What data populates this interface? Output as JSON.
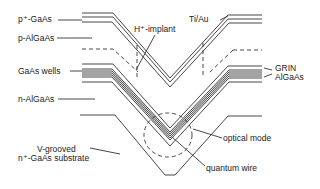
{
  "diagram": {
    "labels": {
      "p_gaas": "p⁺-GaAs",
      "p_algaas": "p-AlGaAs",
      "h_implant": "H⁺-implant",
      "ti_au": "Ti/Au",
      "gaas_wells": "GaAs wells",
      "grin": "GRIN",
      "algaas": "AlGaAs",
      "n_algaas": "n-AlGaAs",
      "substrate_line1": "V-grooved",
      "substrate_line2": "n⁺-GaAs substrate",
      "optical_mode": "optical mode",
      "quantum_wire": "quantum wire"
    },
    "colors": {
      "line": "#333333",
      "background": "#ffffff"
    }
  }
}
